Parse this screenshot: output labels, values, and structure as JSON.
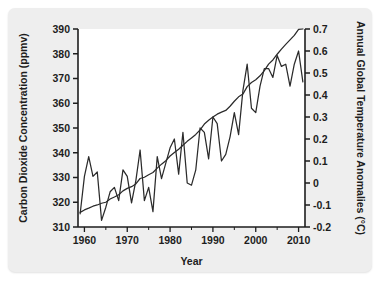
{
  "figure": {
    "background_color": "#eeeeee",
    "plot_background_color": "#ffffff",
    "line_color": "#2b2b2b"
  },
  "chart_data": {
    "type": "line",
    "title": "",
    "xlabel": "Year",
    "ylabel": "Carbon Dioxide Concentration (ppmv)",
    "y2label": "Annual Global Temperature Anomalies (°C)",
    "xlim": [
      1958.5,
      2011.5
    ],
    "ylim": [
      310,
      390
    ],
    "y2lim": [
      -0.2,
      0.7
    ],
    "grid": false,
    "legend": "none",
    "xticks": [
      1960,
      1970,
      1980,
      1990,
      2000,
      2010
    ],
    "xtick_labels": [
      "1960",
      "1970",
      "1980",
      "1990",
      "2000",
      "2010"
    ],
    "xticks_minor": [
      1965,
      1975,
      1985,
      1995,
      2005
    ],
    "yticks": [
      310,
      320,
      330,
      340,
      350,
      360,
      370,
      380,
      390
    ],
    "ytick_labels": [
      "310",
      "320",
      "330",
      "340",
      "350",
      "360",
      "370",
      "380",
      "390"
    ],
    "y2ticks": [
      -0.2,
      -0.1,
      0,
      0.1,
      0.2,
      0.3,
      0.4,
      0.5,
      0.6,
      0.7
    ],
    "y2tick_labels": [
      "-0.2",
      "-0.1",
      "0",
      "0.1",
      "0.2",
      "0.3",
      "0.4",
      "0.5",
      "0.6",
      "0.7"
    ],
    "series": [
      {
        "name": "Carbon Dioxide Concentration",
        "axis": "left",
        "units": "ppmv",
        "x": [
          1959,
          1960,
          1961,
          1962,
          1963,
          1964,
          1965,
          1966,
          1967,
          1968,
          1969,
          1970,
          1971,
          1972,
          1973,
          1974,
          1975,
          1976,
          1977,
          1978,
          1979,
          1980,
          1981,
          1982,
          1983,
          1984,
          1985,
          1986,
          1987,
          1988,
          1989,
          1990,
          1991,
          1992,
          1993,
          1994,
          1995,
          1996,
          1997,
          1998,
          1999,
          2000,
          2001,
          2002,
          2003,
          2004,
          2005,
          2006,
          2007,
          2008,
          2009,
          2010,
          2011
        ],
        "values": [
          315.9,
          316.9,
          317.6,
          318.4,
          318.9,
          319.6,
          320.0,
          321.3,
          322.1,
          323.0,
          324.6,
          325.6,
          326.3,
          327.4,
          329.6,
          330.1,
          331.1,
          332.0,
          333.8,
          335.4,
          336.8,
          338.7,
          340.1,
          341.4,
          343.0,
          344.6,
          346.0,
          347.4,
          349.2,
          351.6,
          353.1,
          354.4,
          355.6,
          356.4,
          357.1,
          358.8,
          360.8,
          362.6,
          363.7,
          366.7,
          368.4,
          369.5,
          371.1,
          373.2,
          375.8,
          377.5,
          379.8,
          381.9,
          383.8,
          385.6,
          387.4,
          389.8,
          390.0
        ]
      },
      {
        "name": "Annual Global Temperature Anomalies",
        "axis": "right",
        "units": "°C",
        "x": [
          1959,
          1960,
          1961,
          1962,
          1963,
          1964,
          1965,
          1966,
          1967,
          1968,
          1969,
          1970,
          1971,
          1972,
          1973,
          1974,
          1975,
          1976,
          1977,
          1978,
          1979,
          1980,
          1981,
          1982,
          1983,
          1984,
          1985,
          1986,
          1987,
          1988,
          1989,
          1990,
          1991,
          1992,
          1993,
          1994,
          1995,
          1996,
          1997,
          1998,
          1999,
          2000,
          2001,
          2002,
          2003,
          2004,
          2005,
          2006,
          2007,
          2008,
          2009,
          2010,
          2011
        ],
        "values": [
          -0.14,
          0.03,
          0.12,
          0.03,
          0.05,
          -0.17,
          -0.11,
          -0.04,
          -0.02,
          -0.08,
          0.06,
          0.03,
          -0.09,
          0.01,
          0.15,
          -0.08,
          -0.02,
          -0.13,
          0.12,
          0.02,
          0.09,
          0.16,
          0.2,
          0.04,
          0.23,
          0.0,
          -0.01,
          0.06,
          0.25,
          0.23,
          0.11,
          0.3,
          0.27,
          0.1,
          0.13,
          0.21,
          0.32,
          0.22,
          0.42,
          0.54,
          0.34,
          0.32,
          0.44,
          0.52,
          0.52,
          0.48,
          0.58,
          0.53,
          0.54,
          0.44,
          0.54,
          0.6,
          0.46
        ]
      }
    ]
  }
}
